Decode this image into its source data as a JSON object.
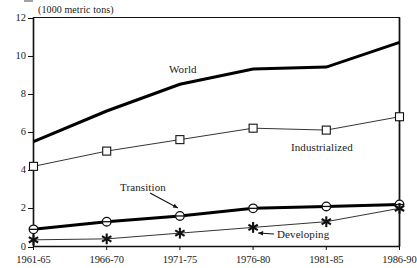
{
  "chart_data": {
    "type": "line",
    "title": "",
    "subtitle": "",
    "ylabel": "(1000 metric tons)",
    "xlabel": "",
    "categories": [
      "1961-65",
      "1966-70",
      "1971-75",
      "1976-80",
      "1981-85",
      "1986-90"
    ],
    "ylim": [
      0,
      12
    ],
    "yticks": [
      0,
      2,
      4,
      6,
      8,
      10,
      12
    ],
    "grid": false,
    "legend": "annotations-on-plot",
    "series": [
      {
        "name": "World",
        "marker": "none",
        "line": "thick-solid",
        "color": "#000000",
        "values": [
          5.5,
          7.1,
          8.5,
          9.3,
          9.4,
          10.7
        ]
      },
      {
        "name": "Industrialized",
        "marker": "square",
        "line": "thin-solid",
        "color": "#000000",
        "values": [
          4.2,
          5.0,
          5.6,
          6.2,
          6.1,
          6.8
        ]
      },
      {
        "name": "Transition",
        "marker": "circle",
        "line": "thick-solid",
        "color": "#000000",
        "values": [
          0.9,
          1.3,
          1.6,
          2.0,
          2.1,
          2.2
        ]
      },
      {
        "name": "Developing",
        "marker": "star",
        "line": "thin-solid",
        "color": "#000000",
        "values": [
          0.35,
          0.4,
          0.7,
          1.0,
          1.3,
          2.0
        ]
      }
    ],
    "annotations": [
      {
        "text": "World",
        "series": "World",
        "arrow": false
      },
      {
        "text": "Industrialized",
        "series": "Industrialized",
        "arrow": false
      },
      {
        "text": "Transition",
        "series": "Transition",
        "arrow": true,
        "arrow_direction": "down-right"
      },
      {
        "text": "Developing",
        "series": "Developing",
        "arrow": true,
        "arrow_direction": "left"
      }
    ]
  },
  "axis": {
    "unit_label": "(1000 metric tons)",
    "y_ticks": [
      "12",
      "10",
      "8",
      "6",
      "4",
      "2",
      "0"
    ],
    "x_ticks": [
      "1961-65",
      "1966-70",
      "1971-75",
      "1976-80",
      "1981-85",
      "1986-90"
    ]
  },
  "labels": {
    "world": "World",
    "industrialized": "Industrialized",
    "transition": "Transition",
    "developing": "Developing"
  }
}
